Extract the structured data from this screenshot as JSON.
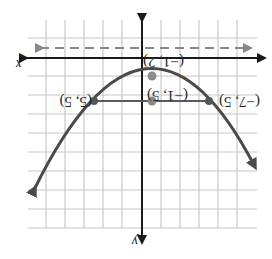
{
  "figure": {
    "orientation": "rotated 180 degrees",
    "axes": {
      "x_label": "x",
      "y_label": "y"
    },
    "points": [
      {
        "label": "(−1, 2)",
        "role": "vertex"
      },
      {
        "label": "(−1, 5)",
        "role": "focus-like point"
      },
      {
        "label": "(5, 5)",
        "role": "point on parabola"
      },
      {
        "label": "(−7, 5)",
        "role": "point on parabola"
      }
    ],
    "elements": [
      "grid",
      "x-axis",
      "y-axis",
      "dashed directrix",
      "parabola",
      "horizontal segment"
    ],
    "colors": {
      "curve": "#4a4a4a",
      "grid": "#c8c8c8",
      "axis": "#1a1a1a",
      "dashed": "#888888"
    }
  }
}
